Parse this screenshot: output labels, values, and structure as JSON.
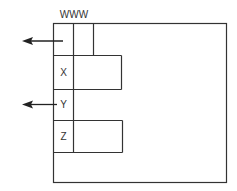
{
  "diagram": {
    "top_label": "WWW",
    "rows": [
      {
        "label": "X"
      },
      {
        "label": "Y"
      },
      {
        "label": "Z"
      }
    ],
    "arrows": [
      {
        "name": "top-arrow",
        "direction": "left",
        "from": "top-left-cell"
      },
      {
        "name": "y-arrow",
        "direction": "left",
        "from": "Y"
      }
    ],
    "colors": {
      "stroke": "#333333",
      "background": "#ffffff"
    }
  }
}
